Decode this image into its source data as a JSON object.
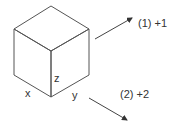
{
  "diagram": {
    "type": "isometric cube with rotation arrows",
    "axes": {
      "x": "x",
      "y": "y",
      "z": "z"
    },
    "arrows": [
      {
        "id": "rotation-1",
        "label": "(1) +1",
        "direction": "up-right"
      },
      {
        "id": "rotation-2",
        "label": "(2) +2",
        "direction": "down-right"
      }
    ],
    "colors": {
      "stroke": "#555555",
      "text": "#333333"
    }
  }
}
